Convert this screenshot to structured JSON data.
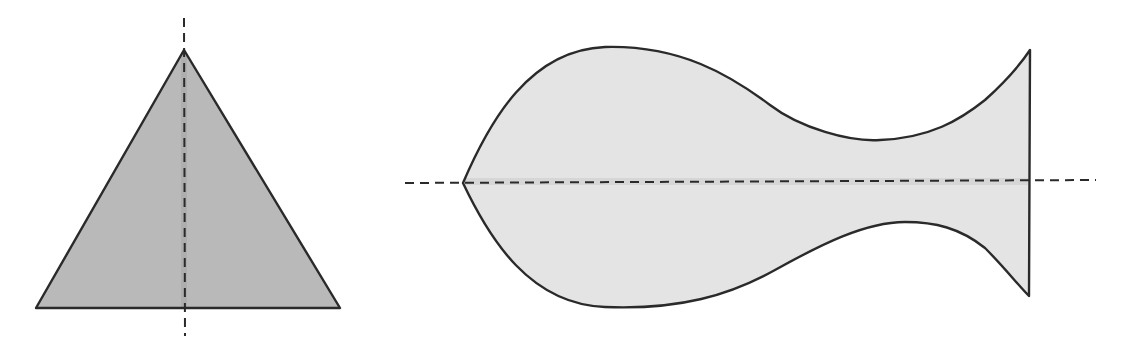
{
  "diagram": {
    "colors": {
      "background": "#ffffff",
      "outline": "#2a2a2a",
      "triangle_fill": "#b9b9b9",
      "fish_fill": "#e4e4e4",
      "symmetry_line": "#2a2a2a"
    },
    "shapes": [
      {
        "name": "triangle",
        "type": "isosceles-triangle",
        "fill": "#b9b9b9",
        "symmetry_axis": "vertical",
        "points": [
          [
            184,
            50
          ],
          [
            340,
            308
          ],
          [
            36,
            308
          ]
        ],
        "axis": {
          "x1": 184,
          "y1": 18,
          "x2": 184,
          "y2": 336
        }
      },
      {
        "name": "fish",
        "type": "fish-outline",
        "fill": "#e4e4e4",
        "symmetry_axis": "horizontal",
        "axis": {
          "x1": 405,
          "y1": 183,
          "x2": 1096,
          "y2": 180
        }
      }
    ]
  }
}
